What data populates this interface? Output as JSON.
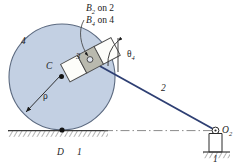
{
  "figure": {
    "type": "kinematic-mechanism-diagram",
    "background_color": "#ffffff"
  },
  "colors": {
    "disc_fill": "#c3d0e3",
    "disc_stroke": "#5c6a80",
    "link_line": "#2e3f73",
    "slider_block_fill": "#b9b9ae",
    "slider_shoe_fill": "#fdfdfa",
    "slider_stroke": "#4a4a4a",
    "ground_line": "#3a3a3a",
    "centerline": "#6b6b6b",
    "text": "#1c1c1c"
  },
  "labels": {
    "b2_on_2": {
      "symbol": "B",
      "subscript": "2",
      "text": " on 2"
    },
    "b4_on_4": {
      "symbol": "B",
      "subscript": "4",
      "text": " on 4"
    },
    "link_4": "4",
    "center_c": "C",
    "radius_rho": "ρ",
    "slider_3": "3",
    "theta_4": {
      "symbol": "θ",
      "subscript": "4"
    },
    "link_2": "2",
    "point_d": "D",
    "ground_1_left": "1",
    "pivot_o2": {
      "symbol": "O",
      "subscript": "2"
    },
    "ground_1_right": "1"
  },
  "geometry": {
    "disc": {
      "cx": 62,
      "cy": 77,
      "r": 53
    },
    "center_point_c": {
      "x": 62,
      "y": 77
    },
    "contact_point_d": {
      "x": 62,
      "y": 130
    },
    "pivot_o2": {
      "x": 216,
      "y": 131
    },
    "pin_b": {
      "x": 90,
      "y": 60
    },
    "rho_arrow_from": {
      "x": 62,
      "y": 77
    },
    "rho_arrow_to": {
      "x": 25,
      "y": 114
    },
    "slider_angle_deg": -28,
    "ground_line_y": 131,
    "theta4_vertical_x": 118
  }
}
